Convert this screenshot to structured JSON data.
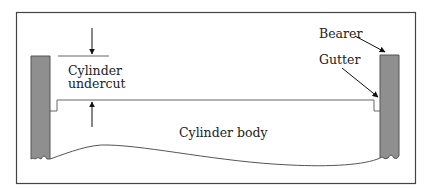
{
  "diagram": {
    "labels": {
      "undercut_line1": "Cylinder",
      "undercut_line2": "undercut",
      "body": "Cylinder body",
      "bearer": "Bearer",
      "gutter": "Gutter"
    },
    "colors": {
      "bearer_fill": "#8f8f8f",
      "line": "#555555",
      "frame": "#444444",
      "background": "#ffffff"
    }
  }
}
